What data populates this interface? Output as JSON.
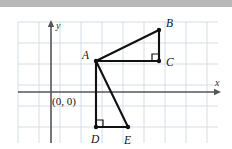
{
  "figure": {
    "canvas": {
      "width": 232,
      "height": 149
    },
    "top_bar_color": "#b8b8b8",
    "background_color": "#ffffff",
    "grid": {
      "color": "#ccd6e0",
      "spacing": 21,
      "x_start": 18,
      "x_end": 218,
      "y_start": 22,
      "y_end": 143,
      "visible": true
    },
    "axes": {
      "color": "#555555",
      "x_axis": {
        "label": "x",
        "y_pixel": 92,
        "x_from": 18,
        "x_to": 221,
        "arrow": "right"
      },
      "y_axis": {
        "label": "y",
        "x_pixel": 51,
        "y_from": 143,
        "y_to": 20,
        "arrow": "up"
      },
      "origin_label": "(0, 0)",
      "origin_label_x": 52,
      "origin_label_y": 105
    },
    "points": [
      {
        "name": "A",
        "x": 96,
        "y": 61,
        "label": "A",
        "label_x": 82,
        "label_y": 59
      },
      {
        "name": "B",
        "x": 159,
        "y": 30,
        "label": "B",
        "label_x": 166,
        "label_y": 27
      },
      {
        "name": "C",
        "x": 159,
        "y": 61,
        "label": "C",
        "label_x": 166,
        "label_y": 66
      },
      {
        "name": "D",
        "x": 96,
        "y": 127,
        "label": "D",
        "label_x": 91,
        "label_y": 143
      },
      {
        "name": "E",
        "x": 128,
        "y": 127,
        "label": "E",
        "label_x": 124,
        "label_y": 144
      }
    ],
    "segments": [
      {
        "name": "A-B",
        "from": "A",
        "to": "B"
      },
      {
        "name": "B-C",
        "from": "B",
        "to": "C"
      },
      {
        "name": "C-A",
        "from": "C",
        "to": "A"
      },
      {
        "name": "A-D",
        "from": "A",
        "to": "D"
      },
      {
        "name": "A-E",
        "from": "A",
        "to": "E"
      },
      {
        "name": "D-E",
        "from": "D",
        "to": "E"
      }
    ],
    "right_angles": [
      {
        "name": "right-angle-at-C",
        "vertex": "C",
        "dir_x": -1,
        "dir_y": -1,
        "size": 7
      },
      {
        "name": "right-angle-at-D",
        "vertex": "D",
        "dir_x": 1,
        "dir_y": -1,
        "size": 7
      }
    ],
    "triangles": [
      {
        "name": "triangle-ABC",
        "vertices": [
          "A",
          "B",
          "C"
        ],
        "right_angle_at": "C"
      },
      {
        "name": "triangle-ADE",
        "vertices": [
          "A",
          "D",
          "E"
        ],
        "right_angle_at": "D"
      }
    ]
  }
}
